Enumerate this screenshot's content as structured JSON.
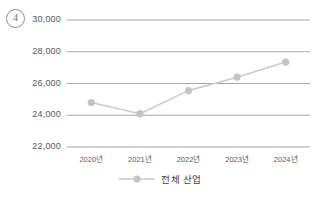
{
  "item_marker": {
    "label": "4",
    "name": "question-number-4"
  },
  "legend": {
    "label": "전체 산업",
    "marker_icon": "line-marker-icon",
    "position": "bottom-center"
  },
  "colors": {
    "line": "#c9cbcd",
    "marker": "#c2c4c6",
    "gridline": "#8e9094",
    "tick_text": "#56585c",
    "background": "#ffffff"
  },
  "chart_data": {
    "type": "line",
    "title": "",
    "subtitle": "",
    "xlabel": "",
    "ylabel": "",
    "categories": [
      "2020년",
      "2021년",
      "2022년",
      "2023년",
      "2024년"
    ],
    "series": [
      {
        "name": "전체 산업",
        "values": [
          24800,
          24100,
          25550,
          26400,
          27350
        ]
      }
    ],
    "ylim": [
      22000,
      30000
    ],
    "y_ticks": [
      30000,
      28000,
      26000,
      24000,
      22000
    ],
    "y_tick_labels": [
      "30,000",
      "28,000",
      "26,000",
      "24,000",
      "22,000"
    ],
    "x_tick_labels": [
      "2020년",
      "2021년",
      "2022년",
      "2023년",
      "2024년"
    ],
    "grid": true,
    "grid_axis": "y",
    "legend_position": "bottom-center",
    "marker_style": "circle"
  }
}
